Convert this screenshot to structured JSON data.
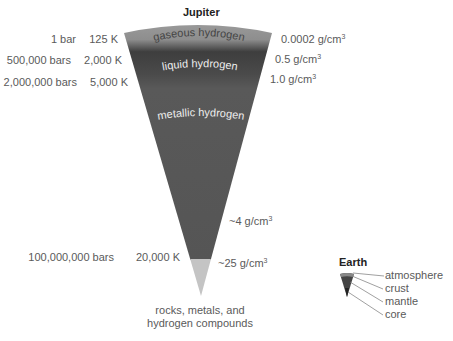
{
  "jupiter": {
    "title": "Jupiter",
    "layers": [
      {
        "name": "gaseous hydrogen",
        "color": "#9a9a9a"
      },
      {
        "name": "liquid hydrogen",
        "color": "#4a4a4a"
      },
      {
        "name": "metallic hydrogen",
        "color": "#575757"
      },
      {
        "name": "rocks, metals, and hydrogen compounds",
        "color": "#c2c2c2"
      }
    ],
    "pressures": [
      "1 bar",
      "500,000 bars",
      "2,000,000 bars",
      "100,000,000 bars"
    ],
    "temperatures": [
      "125 K",
      "2,000 K",
      "5,000 K",
      "20,000 K"
    ],
    "densities": [
      {
        "value": "0.0002 g/cm",
        "exp": "3"
      },
      {
        "value": "0.5 g/cm",
        "exp": "3"
      },
      {
        "value": "1.0 g/cm",
        "exp": "3"
      },
      {
        "value": "~4 g/cm",
        "exp": "3"
      },
      {
        "value": "~25 g/cm",
        "exp": "3"
      }
    ],
    "core_label_line1": "rocks, metals, and",
    "core_label_line2": "hydrogen compounds"
  },
  "earth": {
    "title": "Earth",
    "layers": [
      "atmosphere",
      "crust",
      "mantle",
      "core"
    ]
  }
}
